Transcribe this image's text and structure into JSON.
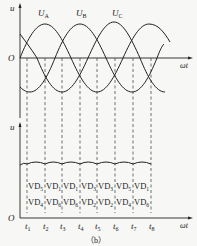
{
  "figure": {
    "caption": "（b）",
    "upper_chart": {
      "y_axis_label": "u",
      "origin_label": "O",
      "x_axis_label": "ωt",
      "phase_labels": [
        {
          "main": "U",
          "sub": "A"
        },
        {
          "main": "U",
          "sub": "B"
        },
        {
          "main": "U",
          "sub": "C"
        }
      ]
    },
    "lower_chart": {
      "y_axis_label": "u",
      "origin_label": "O",
      "x_axis_label": "ωt",
      "time_labels": [
        {
          "main": "t",
          "sub": "1"
        },
        {
          "main": "t",
          "sub": "2"
        },
        {
          "main": "t",
          "sub": "3"
        },
        {
          "main": "t",
          "sub": "4"
        },
        {
          "main": "t",
          "sub": "5"
        },
        {
          "main": "t",
          "sub": "6"
        },
        {
          "main": "t",
          "sub": "7"
        },
        {
          "main": "t",
          "sub": "8"
        }
      ],
      "conducting_top": [
        {
          "main": "VD",
          "sub": "5"
        },
        {
          "main": "VD",
          "sub": "1"
        },
        {
          "main": "VD",
          "sub": "1"
        },
        {
          "main": "VD",
          "sub": "3"
        },
        {
          "main": "VD",
          "sub": "3"
        },
        {
          "main": "VD",
          "sub": "5"
        },
        {
          "main": "VD",
          "sub": "1"
        }
      ],
      "conducting_bottom": [
        {
          "main": "VD",
          "sub": "4"
        },
        {
          "main": "VD",
          "sub": "6"
        },
        {
          "main": "VD",
          "sub": "6"
        },
        {
          "main": "VD",
          "sub": "2"
        },
        {
          "main": "VD",
          "sub": "2"
        },
        {
          "main": "VD",
          "sub": "4"
        },
        {
          "main": "VD",
          "sub": "6"
        }
      ]
    }
  }
}
